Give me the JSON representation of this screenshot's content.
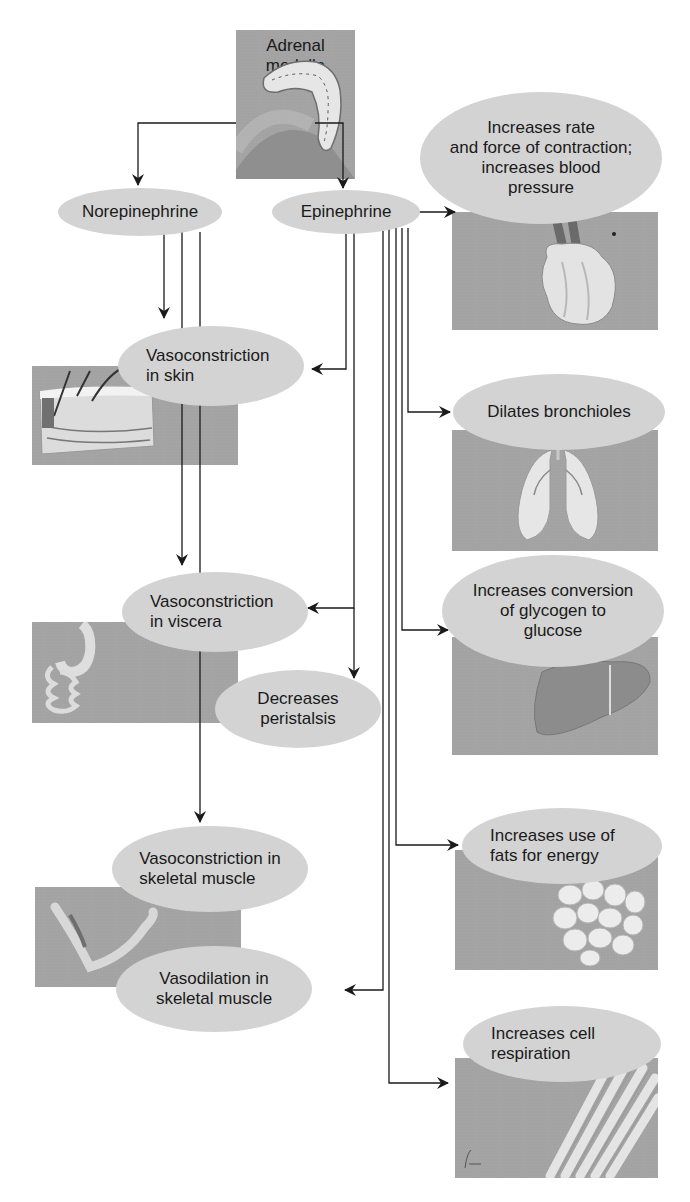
{
  "diagram": {
    "source": {
      "label": "Adrenal medulla",
      "icon": "adrenal-gland-icon"
    },
    "hormones": [
      {
        "id": "norepinephrine",
        "label": "Norepinephrine"
      },
      {
        "id": "epinephrine",
        "label": "Epinephrine"
      }
    ],
    "effects": {
      "heart": {
        "line1": "Increases rate",
        "line2": "and force of contraction;",
        "line3": "increases blood",
        "line4": "pressure",
        "icon": "heart-icon",
        "from": [
          "epinephrine"
        ]
      },
      "skin": {
        "line1": "Vasoconstriction",
        "line2": "in skin",
        "icon": "skin-icon",
        "from": [
          "norepinephrine",
          "epinephrine"
        ]
      },
      "lungs": {
        "line1": "Dilates bronchioles",
        "icon": "lungs-icon",
        "from": [
          "epinephrine"
        ]
      },
      "viscera": {
        "line1": "Vasoconstriction",
        "line2": "in viscera",
        "icon": "digestive-tract-icon",
        "from": [
          "norepinephrine",
          "epinephrine"
        ]
      },
      "liver": {
        "line1": "Increases conversion",
        "line2": "of glycogen to",
        "line3": "glucose",
        "icon": "liver-icon",
        "from": [
          "epinephrine"
        ]
      },
      "peristalsis": {
        "line1": "Decreases",
        "line2": "peristalsis",
        "from": [
          "epinephrine"
        ]
      },
      "fats": {
        "line1": "Increases use of",
        "line2": "fats for energy",
        "icon": "adipose-tissue-icon",
        "from": [
          "epinephrine"
        ]
      },
      "skeletal_constriction": {
        "line1": "Vasoconstriction in",
        "line2": "skeletal muscle",
        "icon": "arm-muscle-icon",
        "from": [
          "norepinephrine"
        ]
      },
      "skeletal_dilation": {
        "line1": "Vasodilation in",
        "line2": "skeletal muscle",
        "from": [
          "epinephrine"
        ]
      },
      "respiration": {
        "line1": "Increases cell",
        "line2": "respiration",
        "icon": "muscle-fibers-icon",
        "from": [
          "epinephrine"
        ]
      }
    },
    "colors": {
      "panel": "#a3a3a3",
      "oval": "#d3d3d3",
      "line": "#1a1a1a",
      "background": "#ffffff"
    }
  }
}
